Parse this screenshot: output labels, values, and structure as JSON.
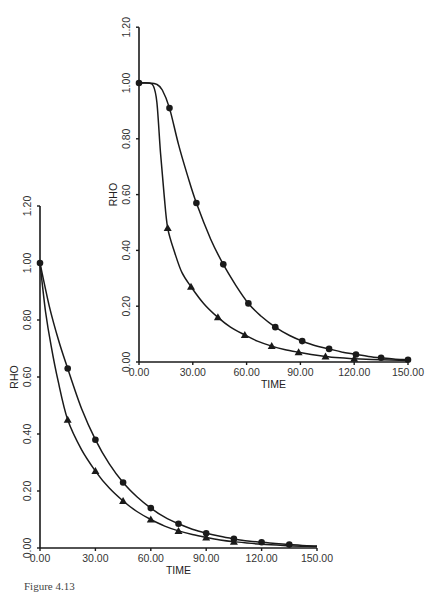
{
  "caption": "Figure 4.13",
  "chart_data": [
    {
      "type": "line",
      "name": "top-panel",
      "title": "",
      "xlabel": "TIME",
      "ylabel": "RHO",
      "xlim": [
        0,
        150
      ],
      "ylim": [
        0,
        1.2
      ],
      "x_ticks": [
        "0.00",
        "30.00",
        "60.00",
        "90.00",
        "120.00",
        "150.00"
      ],
      "y_ticks": [
        "0.00",
        "0.20",
        "0.40",
        "0.60",
        "0.80",
        "1.00",
        "1.20"
      ],
      "grid": false,
      "legend": null,
      "series": [
        {
          "name": "circles",
          "marker": "circle",
          "x": [
            0,
            17,
            32,
            47,
            61,
            76,
            91,
            106,
            121,
            135,
            150
          ],
          "y": [
            1.0,
            0.91,
            0.57,
            0.35,
            0.21,
            0.125,
            0.075,
            0.047,
            0.027,
            0.015,
            0.008
          ],
          "curve": [
            [
              0,
              1.0
            ],
            [
              5,
              1.0
            ],
            [
              10,
              0.995
            ],
            [
              13,
              0.975
            ],
            [
              17,
              0.91
            ],
            [
              22,
              0.78
            ],
            [
              27,
              0.67
            ],
            [
              32,
              0.57
            ],
            [
              40,
              0.44
            ],
            [
              47,
              0.35
            ],
            [
              54,
              0.275
            ],
            [
              61,
              0.21
            ],
            [
              68,
              0.165
            ],
            [
              76,
              0.125
            ],
            [
              84,
              0.095
            ],
            [
              91,
              0.075
            ],
            [
              98,
              0.059
            ],
            [
              106,
              0.047
            ],
            [
              113,
              0.036
            ],
            [
              121,
              0.027
            ],
            [
              128,
              0.02
            ],
            [
              135,
              0.015
            ],
            [
              142,
              0.011
            ],
            [
              150,
              0.008
            ]
          ]
        },
        {
          "name": "triangles",
          "marker": "triangle",
          "x": [
            16,
            29,
            44,
            59,
            74,
            89,
            104,
            120
          ],
          "y": [
            0.48,
            0.27,
            0.16,
            0.097,
            0.057,
            0.035,
            0.02,
            0.012
          ],
          "curve": [
            [
              0,
              1.0
            ],
            [
              5,
              1.0
            ],
            [
              8,
              0.99
            ],
            [
              10,
              0.93
            ],
            [
              12,
              0.75
            ],
            [
              14,
              0.6
            ],
            [
              16,
              0.48
            ],
            [
              20,
              0.39
            ],
            [
              24,
              0.32
            ],
            [
              29,
              0.27
            ],
            [
              36,
              0.21
            ],
            [
              44,
              0.16
            ],
            [
              51,
              0.125
            ],
            [
              59,
              0.097
            ],
            [
              66,
              0.075
            ],
            [
              74,
              0.057
            ],
            [
              81,
              0.045
            ],
            [
              89,
              0.035
            ],
            [
              96,
              0.027
            ],
            [
              104,
              0.02
            ],
            [
              112,
              0.015
            ],
            [
              120,
              0.012
            ],
            [
              135,
              0.008
            ],
            [
              150,
              0.005
            ]
          ]
        }
      ]
    },
    {
      "type": "line",
      "name": "bottom-panel",
      "title": "",
      "xlabel": "TIME",
      "ylabel": "RHO",
      "xlim": [
        0,
        150
      ],
      "ylim": [
        0,
        1.2
      ],
      "x_ticks": [
        "0.00",
        "30.00",
        "60.00",
        "90.00",
        "120.00",
        "150.00"
      ],
      "y_ticks": [
        "0.00",
        "0.20",
        "0.40",
        "0.60",
        "0.80",
        "1.00",
        "1.20"
      ],
      "grid": false,
      "legend": null,
      "series": [
        {
          "name": "circles",
          "marker": "circle",
          "x": [
            0,
            15,
            30,
            45,
            60,
            75,
            90,
            105,
            120,
            135
          ],
          "y": [
            1.0,
            0.63,
            0.38,
            0.23,
            0.14,
            0.085,
            0.052,
            0.032,
            0.02,
            0.012
          ],
          "curve": [
            [
              0,
              1.0
            ],
            [
              5,
              0.85
            ],
            [
              10,
              0.73
            ],
            [
              15,
              0.63
            ],
            [
              22.5,
              0.49
            ],
            [
              30,
              0.38
            ],
            [
              37.5,
              0.295
            ],
            [
              45,
              0.23
            ],
            [
              52.5,
              0.18
            ],
            [
              60,
              0.14
            ],
            [
              67.5,
              0.108
            ],
            [
              75,
              0.085
            ],
            [
              82.5,
              0.066
            ],
            [
              90,
              0.052
            ],
            [
              97.5,
              0.041
            ],
            [
              105,
              0.032
            ],
            [
              112.5,
              0.025
            ],
            [
              120,
              0.02
            ],
            [
              127.5,
              0.016
            ],
            [
              135,
              0.012
            ],
            [
              142,
              0.009
            ],
            [
              150,
              0.007
            ]
          ]
        },
        {
          "name": "triangles",
          "marker": "triangle",
          "x": [
            15,
            30,
            45,
            60,
            75,
            90,
            105
          ],
          "y": [
            0.45,
            0.27,
            0.165,
            0.1,
            0.06,
            0.037,
            0.022
          ],
          "curve": [
            [
              0,
              1.0
            ],
            [
              3,
              0.83
            ],
            [
              6,
              0.71
            ],
            [
              10,
              0.58
            ],
            [
              15,
              0.45
            ],
            [
              22.5,
              0.345
            ],
            [
              30,
              0.27
            ],
            [
              37.5,
              0.21
            ],
            [
              45,
              0.165
            ],
            [
              52.5,
              0.128
            ],
            [
              60,
              0.1
            ],
            [
              67.5,
              0.077
            ],
            [
              75,
              0.06
            ],
            [
              82.5,
              0.047
            ],
            [
              90,
              0.037
            ],
            [
              97.5,
              0.028
            ],
            [
              105,
              0.022
            ],
            [
              120,
              0.013
            ],
            [
              135,
              0.008
            ],
            [
              150,
              0.005
            ]
          ]
        }
      ]
    }
  ],
  "layout": {
    "panels": [
      {
        "x0": 139,
        "y0": 362,
        "x150": 408,
        "y1": 83
      },
      {
        "x0": 40,
        "y0": 548,
        "x150": 317,
        "y1": 263
      }
    ]
  }
}
